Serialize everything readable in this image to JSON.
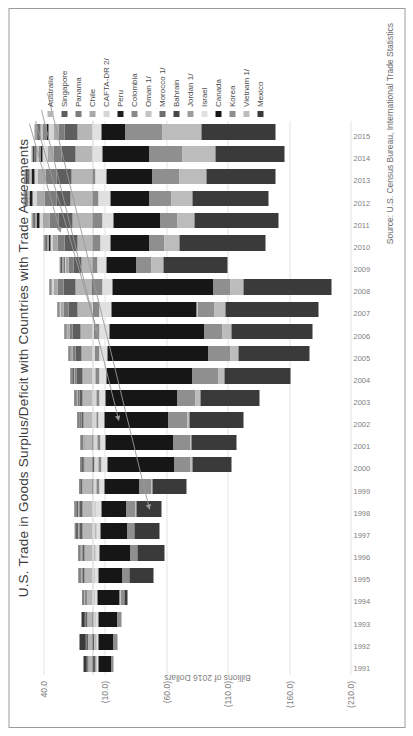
{
  "chart_data": {
    "type": "bar",
    "subtype": "stacked-column",
    "title": "U.S. Trade in Goods Surplus/Deficit with Countries with Trade Agreements",
    "xlabel": "",
    "ylabel": "Billions of 2016 Dollars",
    "source": "Source: U.S. Census Bureau, International Trade Statistics",
    "ylim": [
      -210,
      40
    ],
    "ytick_labels": [
      "40.0",
      "(10.0)",
      "(60.0)",
      "(110.0)",
      "(160.0)",
      "(210.0)"
    ],
    "ytick_values": [
      40,
      -10,
      -60,
      -110,
      -160,
      -210
    ],
    "grid": true,
    "legend_position": "right",
    "orientation_note": "figure rendered rotated 90 degrees counter-clockwise in screenshot",
    "categories": [
      "1991",
      "1992",
      "1993",
      "1994",
      "1995",
      "1996",
      "1997",
      "1998",
      "1999",
      "2000",
      "2001",
      "2002",
      "2003",
      "2004",
      "2005",
      "2006",
      "2007",
      "2008",
      "2009",
      "2010",
      "2011",
      "2012",
      "2013",
      "2014",
      "2015"
    ],
    "series": [
      {
        "name": "Australia",
        "color": "#b6b6b6",
        "values": [
          3.5,
          4.0,
          4.5,
          5.5,
          6.5,
          7.0,
          8.0,
          8.5,
          8.0,
          7.0,
          6.5,
          7.5,
          8.0,
          8.5,
          9.0,
          10.0,
          12.0,
          14.0,
          9.0,
          12.5,
          16.0,
          18.0,
          17.0,
          14.0,
          12.0
        ]
      },
      {
        "name": "Singapore",
        "color": "#5e5e5e",
        "values": [
          -2.0,
          -1.5,
          -1.0,
          0.5,
          1.5,
          1.0,
          2.5,
          2.0,
          -1.0,
          -1.5,
          -1.0,
          1.5,
          3.0,
          4.5,
          5.0,
          6.0,
          8.0,
          10.0,
          6.5,
          10.5,
          12.0,
          11.5,
          12.5,
          11.0,
          10.5
        ]
      },
      {
        "name": "Panama",
        "color": "#7d7d7d",
        "values": [
          0.5,
          0.6,
          0.7,
          0.8,
          0.9,
          1.0,
          1.1,
          1.2,
          1.1,
          1.2,
          1.3,
          1.4,
          1.5,
          1.8,
          2.0,
          2.5,
          3.5,
          4.5,
          4.0,
          5.5,
          7.5,
          9.5,
          8.5,
          7.0,
          5.5
        ]
      },
      {
        "name": "Chile",
        "color": "#a8a8a8",
        "values": [
          0.4,
          0.5,
          0.7,
          0.8,
          1.0,
          1.0,
          1.2,
          1.3,
          0.8,
          0.9,
          0.9,
          1.0,
          1.2,
          1.6,
          2.0,
          2.5,
          3.0,
          3.5,
          2.5,
          4.0,
          5.5,
          7.0,
          6.5,
          5.0,
          4.0
        ]
      },
      {
        "name": "CAFTA-DR 2/",
        "color": "#d6d6d6",
        "values": [
          -0.5,
          -0.8,
          -1.0,
          -1.2,
          -1.5,
          -1.8,
          -2.0,
          -2.2,
          -2.5,
          -3.0,
          -3.2,
          -3.0,
          -2.8,
          -2.5,
          -2.2,
          -1.5,
          -0.5,
          0.5,
          1.5,
          2.0,
          2.5,
          3.0,
          3.0,
          3.5,
          4.0
        ]
      },
      {
        "name": "Peru",
        "color": "#1f1f1f",
        "values": [
          0.2,
          0.2,
          0.3,
          0.3,
          0.4,
          0.4,
          0.5,
          0.5,
          0.3,
          0.3,
          0.2,
          0.2,
          0.2,
          0.1,
          -0.2,
          -0.5,
          -0.5,
          -0.5,
          0.5,
          1.5,
          2.0,
          2.5,
          2.5,
          2.0,
          1.8
        ]
      },
      {
        "name": "Colombia",
        "color": "#888888",
        "values": [
          -0.5,
          -0.6,
          -0.4,
          -0.3,
          -0.2,
          -0.5,
          -0.8,
          -0.5,
          -2.0,
          -2.5,
          -2.0,
          -2.0,
          -2.5,
          -3.0,
          -3.5,
          -4.0,
          -5.0,
          -7.5,
          -4.0,
          -6.5,
          -8.0,
          -5.0,
          -2.0,
          1.5,
          3.0
        ]
      },
      {
        "name": "Oman 1/",
        "color": "#c4c4c4",
        "values": [
          0.2,
          0.2,
          0.2,
          0.2,
          0.3,
          0.3,
          0.3,
          0.3,
          0.2,
          0.2,
          0.2,
          0.3,
          0.3,
          0.4,
          0.5,
          0.6,
          0.6,
          0.7,
          0.8,
          0.9,
          1.0,
          1.2,
          1.4,
          1.6,
          1.8
        ]
      },
      {
        "name": "Morocco 1/",
        "color": "#6e6e6e",
        "values": [
          0.3,
          0.3,
          0.3,
          0.3,
          0.4,
          0.4,
          0.4,
          0.4,
          0.3,
          0.3,
          0.3,
          0.3,
          0.4,
          0.5,
          0.6,
          0.7,
          0.8,
          1.0,
          1.0,
          1.2,
          1.5,
          1.8,
          2.0,
          2.0,
          2.0
        ]
      },
      {
        "name": "Bahrain",
        "color": "#474747",
        "values": [
          0.1,
          0.1,
          0.1,
          0.1,
          0.2,
          0.2,
          0.2,
          0.2,
          0.1,
          0.1,
          0.1,
          0.2,
          0.2,
          0.3,
          0.3,
          0.4,
          0.5,
          0.6,
          0.6,
          0.7,
          0.8,
          0.9,
          1.0,
          1.0,
          1.0
        ]
      },
      {
        "name": "Jordan 1/",
        "color": "#9e9e9e",
        "values": [
          0.1,
          0.1,
          0.1,
          0.1,
          0.1,
          0.1,
          0.2,
          0.2,
          0.2,
          0.2,
          0.2,
          0.3,
          0.3,
          0.3,
          0.4,
          0.4,
          0.5,
          0.6,
          0.6,
          0.8,
          1.0,
          1.2,
          1.3,
          1.4,
          1.5
        ]
      },
      {
        "name": "Israel",
        "color": "#e0e0e0",
        "values": [
          -2.0,
          -2.2,
          -2.5,
          -2.8,
          -3.0,
          -3.5,
          -4.0,
          -4.5,
          -4.5,
          -5.0,
          -4.5,
          -5.0,
          -5.5,
          -6.0,
          -6.5,
          -7.5,
          -9.0,
          -8.5,
          -7.0,
          -8.0,
          -9.0,
          -9.5,
          -9.0,
          -8.0,
          -7.0
        ]
      },
      {
        "name": "Canada",
        "color": "#161616",
        "values": [
          -10.0,
          -12.0,
          -15.0,
          -18.0,
          -20.0,
          -25.0,
          -22.0,
          -20.0,
          -28.0,
          -55.0,
          -55.0,
          -52.0,
          -58.0,
          -70.0,
          -82.0,
          -78.0,
          -70.0,
          -82.0,
          -25.0,
          -32.0,
          -38.0,
          -32.0,
          -38.0,
          -38.0,
          -20.0
        ]
      },
      {
        "name": "Korea",
        "color": "#8f8f8f",
        "values": [
          -2.0,
          -3.0,
          -3.5,
          -4.0,
          -5.0,
          -5.5,
          -5.0,
          -8.0,
          -10.0,
          -13.0,
          -14.0,
          -15.0,
          -15.0,
          -21.0,
          -18.0,
          -14.0,
          -14.0,
          -14.0,
          -12.0,
          -12.0,
          -14.0,
          -18.0,
          -22.0,
          -27.0,
          -30.0
        ]
      },
      {
        "name": "Vietnam 1/",
        "color": "#bcbcbc",
        "values": [
          0.0,
          0.0,
          0.0,
          0.0,
          -0.2,
          -0.3,
          -0.5,
          -0.6,
          -0.8,
          -1.0,
          -1.2,
          -2.0,
          -4.0,
          -5.0,
          -6.0,
          -7.5,
          -9.0,
          -10.0,
          -10.0,
          -12.0,
          -14.0,
          -17.0,
          -22.0,
          -27.0,
          -32.0
        ]
      },
      {
        "name": "Mexico",
        "color": "#3a3a3a",
        "values": [
          2.5,
          5.0,
          2.0,
          -2.0,
          -20.0,
          -22.0,
          -20.0,
          -20.0,
          -28.0,
          -32.0,
          -36.0,
          -44.0,
          -48.0,
          -54.0,
          -58.0,
          -66.0,
          -76.0,
          -72.0,
          -52.0,
          -70.0,
          -68.0,
          -62.0,
          -56.0,
          -56.0,
          -60.0
        ]
      }
    ],
    "legend_entries": [
      {
        "label": "Australia",
        "color": "#b6b6b6"
      },
      {
        "label": "Singapore",
        "color": "#5e5e5e"
      },
      {
        "label": "Panama",
        "color": "#7d7d7d"
      },
      {
        "label": "Chile",
        "color": "#a8a8a8"
      },
      {
        "label": "CAFTA-DR 2/",
        "color": "#d6d6d6"
      },
      {
        "label": "Peru",
        "color": "#1f1f1f"
      },
      {
        "label": "Colombia",
        "color": "#888888"
      },
      {
        "label": "Oman 1/",
        "color": "#c4c4c4"
      },
      {
        "label": "Morocco 1/",
        "color": "#6e6e6e"
      },
      {
        "label": "Bahrain",
        "color": "#474747"
      },
      {
        "label": "Jordan 1/",
        "color": "#9e9e9e"
      },
      {
        "label": "Israel",
        "color": "#e0e0e0"
      },
      {
        "label": "Canada",
        "color": "#161616"
      },
      {
        "label": "Korea",
        "color": "#8f8f8f"
      },
      {
        "label": "Vietnam 1/",
        "color": "#bcbcbc"
      },
      {
        "label": "Mexico",
        "color": "#3a3a3a"
      }
    ],
    "annotations": [
      {
        "name": "callout-canada",
        "target_series": "Canada"
      },
      {
        "name": "callout-korea",
        "target_series": "Korea"
      },
      {
        "name": "callout-vietnam",
        "target_series": "Vietnam 1/"
      },
      {
        "name": "callout-mexico",
        "target_series": "Mexico"
      }
    ]
  }
}
